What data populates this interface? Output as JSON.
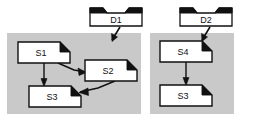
{
  "diagram": {
    "title": "",
    "colors": {
      "background": "#ffffff",
      "group_fill": "#c9c9c9",
      "node_fill": "#ffffff",
      "stroke": "#111111",
      "corner_fill": "#111111"
    },
    "groups": [
      {
        "id": "group-left",
        "label": "",
        "x": 7,
        "y": 33,
        "w": 134,
        "h": 81
      },
      {
        "id": "group-right",
        "label": "",
        "x": 150,
        "y": 33,
        "w": 84,
        "h": 81
      }
    ],
    "data_nodes": [
      {
        "id": "d1",
        "label": "D1",
        "x": 90,
        "y": 8,
        "w": 52,
        "h": 18
      },
      {
        "id": "d2",
        "label": "D2",
        "x": 180,
        "y": 8,
        "w": 52,
        "h": 18
      }
    ],
    "process_nodes": [
      {
        "id": "s1",
        "label": "S1",
        "x": 18,
        "y": 42,
        "w": 52,
        "h": 21
      },
      {
        "id": "s2",
        "label": "S2",
        "x": 85,
        "y": 60,
        "w": 52,
        "h": 21
      },
      {
        "id": "s3a",
        "label": "S3",
        "x": 29,
        "y": 86,
        "w": 52,
        "h": 21
      },
      {
        "id": "s4",
        "label": "S4",
        "x": 160,
        "y": 41,
        "w": 52,
        "h": 21
      },
      {
        "id": "s3b",
        "label": "S3",
        "x": 160,
        "y": 85,
        "w": 52,
        "h": 21
      }
    ],
    "edges": [
      {
        "id": "edge-d1-group-left",
        "from": "d1",
        "to": "group-left",
        "label": ""
      },
      {
        "id": "edge-d2-group-right",
        "from": "d2",
        "to": "group-right",
        "label": ""
      },
      {
        "id": "edge-s1-s2",
        "from": "s1",
        "to": "s2",
        "label": ""
      },
      {
        "id": "edge-s1-s3",
        "from": "s1",
        "to": "s3a",
        "label": ""
      },
      {
        "id": "edge-s2-s3",
        "from": "s2",
        "to": "s3a",
        "label": ""
      },
      {
        "id": "edge-s4-s3",
        "from": "s4",
        "to": "s3b",
        "label": ""
      }
    ]
  }
}
